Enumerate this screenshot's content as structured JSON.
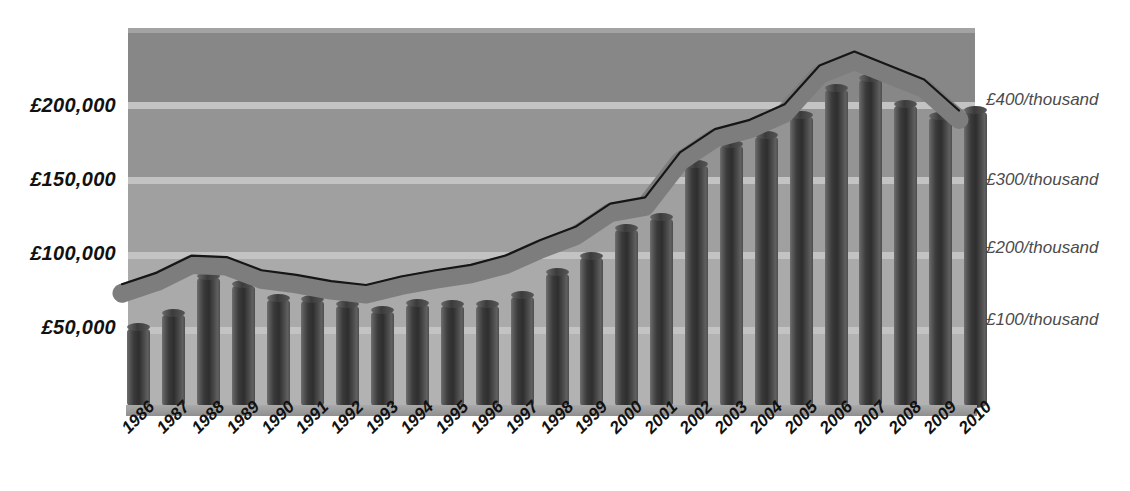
{
  "chart_data": {
    "type": "bar",
    "title": "",
    "subtitle": "",
    "xlabel": "",
    "ylabel": "",
    "grid": true,
    "legend_position": "none",
    "categories": [
      "1986",
      "1987",
      "1988",
      "1989",
      "1990",
      "1991",
      "1992",
      "1993",
      "1994",
      "1995",
      "1996",
      "1997",
      "1998",
      "1999",
      "2000",
      "2001",
      "2002",
      "2003",
      "2004",
      "2005",
      "2006",
      "2007",
      "2008",
      "2009",
      "2010"
    ],
    "left_axis": {
      "label": "",
      "ticks": [
        "£50,000",
        "£100,000",
        "£150,000",
        "£200,000"
      ],
      "tick_values": [
        50000,
        100000,
        150000,
        200000
      ],
      "min": 0,
      "max": 245000
    },
    "right_axis": {
      "label": "",
      "ticks": [
        "£100/thousand",
        "£200/thousand",
        "£300/thousand",
        "£400/thousand"
      ],
      "tick_values": [
        100,
        200,
        300,
        400
      ],
      "min": 0,
      "max": 490
    },
    "series": [
      {
        "name": "Average house price",
        "type": "bar",
        "axis": "left",
        "unit": "£",
        "values": [
          52000,
          61000,
          85000,
          80000,
          71000,
          70000,
          67000,
          63000,
          68000,
          67000,
          67000,
          73000,
          88000,
          98000,
          116000,
          123000,
          157000,
          170000,
          176000,
          189000,
          206000,
          213000,
          196000,
          188000,
          192000
        ]
      },
      {
        "name": "Average price per thousand",
        "type": "line",
        "axis": "right",
        "unit": "£/thousand",
        "values": [
          148,
          163,
          185,
          183,
          166,
          160,
          152,
          147,
          158,
          166,
          173,
          185,
          205,
          222,
          252,
          260,
          318,
          348,
          360,
          380,
          430,
          448,
          430,
          412,
          372
        ]
      }
    ]
  },
  "axes": {
    "left_ticks": [
      {
        "label": "£200,000",
        "top": 94
      },
      {
        "label": "£150,000",
        "top": 168
      },
      {
        "label": "£100,000",
        "top": 242
      },
      {
        "label": "£50,000",
        "top": 316
      }
    ],
    "right_ticks": [
      {
        "label": "£400/thousand",
        "top": 90
      },
      {
        "label": "£300/thousand",
        "top": 170
      },
      {
        "label": "£200/thousand",
        "top": 238
      },
      {
        "label": "£100/thousand",
        "top": 310
      }
    ]
  },
  "colors": {
    "bar_dark": "#2e2e2e",
    "bar_light": "#6f6f6f",
    "ribbon": "#7d7d7d",
    "ribbon_edge": "#1d1d1d",
    "gridline": "#c3c3c3",
    "plot_band_top": "#8c8c8c",
    "plot_band_bottom": "#b4b4b4",
    "baseline": "#9a9a9a",
    "axis_text_left": "#111111",
    "axis_text_right": "#4b4b4b"
  }
}
